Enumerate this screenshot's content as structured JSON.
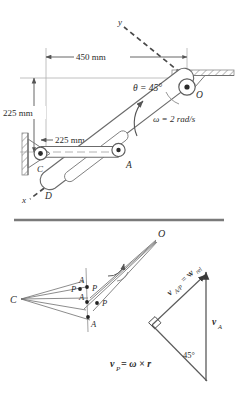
{
  "figure": {
    "upper": {
      "name": "mechanism-layout",
      "dimensions": [
        {
          "id": "horizontal-450",
          "label": "450 mm",
          "value": 450,
          "unit": "mm"
        },
        {
          "id": "vertical-225",
          "label": "225 mm",
          "value": 225,
          "unit": "mm"
        },
        {
          "id": "horizontal-225",
          "label": "225 mm",
          "value": 225,
          "unit": "mm"
        }
      ],
      "angle": {
        "symbol": "θ",
        "label": "θ = 45°",
        "value": 45,
        "unit": "deg"
      },
      "angular_velocity": {
        "symbol": "ω",
        "label": "ω = 2 rad/s",
        "value": 2,
        "unit": "rad/s"
      },
      "points": [
        {
          "id": "point-O",
          "label": "O"
        },
        {
          "id": "point-C",
          "label": "C"
        },
        {
          "id": "point-A",
          "label": "A"
        },
        {
          "id": "point-D",
          "label": "D"
        }
      ],
      "axes": [
        {
          "id": "axis-x",
          "label": "x"
        },
        {
          "id": "axis-y",
          "label": "y"
        }
      ]
    },
    "lower": {
      "name": "velocity-vector-diagram",
      "points": [
        {
          "id": "lower-point-O",
          "label": "O"
        },
        {
          "id": "lower-point-C",
          "label": "C"
        },
        {
          "id": "lower-point-A-top",
          "label": "A"
        },
        {
          "id": "lower-point-P-left",
          "label": "P"
        },
        {
          "id": "lower-point-P-top",
          "label": "P"
        },
        {
          "id": "lower-point-A-mid",
          "label": "A"
        },
        {
          "id": "lower-point-P-right",
          "label": "P"
        },
        {
          "id": "lower-point-A-bottom",
          "label": "A"
        }
      ],
      "triangle": {
        "relative_velocity_label": "v",
        "relative_velocity_sub": "A/P",
        "relative_velocity_eq": " = v",
        "relative_velocity_sub2": "rel",
        "absolute_velocity_label": "v",
        "absolute_velocity_sub": "A",
        "angle_label": "45°",
        "right_angle": true
      },
      "equation": {
        "vp": "v",
        "vp_sub": "P",
        "rest": " = ω × r",
        "full": "v_P = ω × r"
      }
    },
    "colors": {
      "ink": "#2b2b2b",
      "line": "#555555",
      "light_line": "#9a9a9a",
      "hatch": "#b8b8b8",
      "background": "#ffffff",
      "divider": "#7a7a7a"
    }
  }
}
